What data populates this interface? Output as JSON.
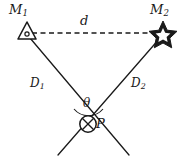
{
  "figure": {
    "name": "triangulation-geometry-diagram",
    "background_color": "#ffffff",
    "stroke_color": "#1a1a1a",
    "labels": {
      "m1": "M",
      "m1_sub": "1",
      "m2": "M",
      "m2_sub": "2",
      "baseline": "d",
      "d1": "D",
      "d1_sub": "1",
      "d2": "D",
      "d2_sub": "2",
      "angle": "θ",
      "point": "P"
    },
    "markers": {
      "m1_icon": "triangle-marker-icon",
      "m2_icon": "star-marker-icon",
      "p_icon": "crossed-circle-marker-icon"
    },
    "geometry": {
      "m1_point": [
        27,
        33
      ],
      "m2_point": [
        163,
        33
      ],
      "p_point": [
        88,
        124
      ],
      "baseline_style": "dashed",
      "angle_arc_radius": 18
    }
  }
}
